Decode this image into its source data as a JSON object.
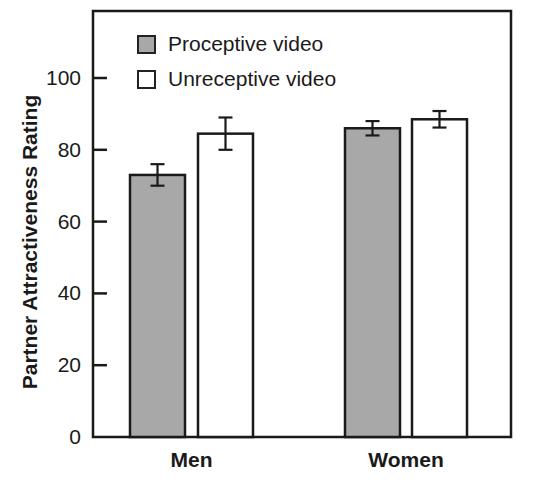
{
  "chart_data": {
    "type": "bar",
    "title": "",
    "xlabel": "",
    "ylabel": "Partner Attractiveness Rating",
    "ylim": [
      0,
      120
    ],
    "yticks": [
      0,
      20,
      40,
      60,
      80,
      100
    ],
    "ytick_labels": [
      "0",
      "20",
      "40",
      "60",
      "80",
      "100"
    ],
    "categories": [
      "Men",
      "Women"
    ],
    "series": [
      {
        "name": "Proceptive video",
        "color": "#a8a8a8",
        "values": [
          73,
          86
        ],
        "errors": [
          3,
          2
        ]
      },
      {
        "name": "Unreceptive video",
        "color": "#ffffff",
        "values": [
          84.5,
          88.5
        ],
        "errors": [
          4.5,
          2.3
        ]
      }
    ],
    "error_bars": true,
    "grid": false,
    "legend_position": "upper-left inside"
  }
}
